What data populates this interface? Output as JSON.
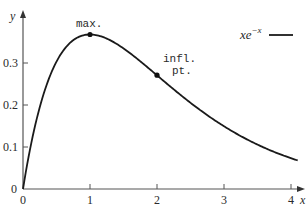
{
  "chart_data": {
    "type": "line",
    "title": "",
    "xlabel": "x",
    "ylabel": "y",
    "xlim": [
      0,
      4.1
    ],
    "ylim": [
      0,
      0.38
    ],
    "grid": false,
    "legend_position": "top-right",
    "x_ticks": [
      "0",
      "1",
      "2",
      "3",
      "4"
    ],
    "y_ticks": [
      "0",
      "0.1",
      "0.2",
      "0.3"
    ],
    "series": [
      {
        "name": "xe^{-x}",
        "function": "x*exp(-x)",
        "x": [
          0,
          0.25,
          0.5,
          0.75,
          1,
          1.25,
          1.5,
          1.75,
          2,
          2.5,
          3,
          3.5,
          4
        ],
        "values": [
          0,
          0.195,
          0.303,
          0.354,
          0.368,
          0.358,
          0.335,
          0.304,
          0.271,
          0.205,
          0.149,
          0.106,
          0.073
        ]
      }
    ],
    "annotations": [
      {
        "text": "max.",
        "x": 1,
        "y": 0.368
      },
      {
        "text": "infl. pt.",
        "x": 2,
        "y": 0.271
      }
    ]
  },
  "axes": {
    "x_label": "x",
    "y_label": "y",
    "origin_label": "0",
    "x_tick_labels": [
      "0",
      "1",
      "2",
      "3",
      "4"
    ],
    "y_tick_labels": [
      "0.1",
      "0.2",
      "0.3"
    ]
  },
  "annotations": {
    "max_label": "max.",
    "infl_label_line1": "infl.",
    "infl_label_line2": "pt."
  },
  "legend": {
    "base": "xe",
    "exponent": "−x"
  }
}
